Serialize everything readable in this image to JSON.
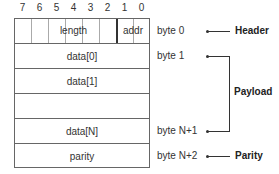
{
  "bits": [
    "7",
    "6",
    "5",
    "4",
    "3",
    "2",
    "1",
    "0"
  ],
  "header_row": {
    "length_label": "length",
    "addr_label": "addr"
  },
  "rows": [
    {
      "label": "data[0]"
    },
    {
      "label": "data[1]"
    },
    {
      "label": ""
    },
    {
      "label": "data[N]"
    },
    {
      "label": "parity"
    }
  ],
  "byte_labels": {
    "byte0": "byte 0",
    "byte1": "byte 1",
    "byteN1": "byte N+1",
    "byteN2": "byte N+2"
  },
  "sections": {
    "header": "Header",
    "payload": "Payload",
    "parity": "Parity"
  }
}
